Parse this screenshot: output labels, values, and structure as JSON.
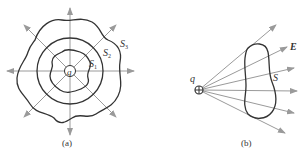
{
  "panel_a": {
    "caption": "(a)",
    "charge_label": "q",
    "surfaces": [
      {
        "name": "S1",
        "base": "S",
        "sub": "1",
        "shape": "irregular-inner"
      },
      {
        "name": "S2",
        "base": "S",
        "sub": "2",
        "shape": "circle"
      },
      {
        "name": "S3",
        "base": "S",
        "sub": "3",
        "shape": "irregular-outer"
      }
    ],
    "field_lines": 8
  },
  "panel_b": {
    "caption": "(b)",
    "charge_label": "q",
    "field_label": "E",
    "surface_label": "S",
    "field_lines": 7
  },
  "colors": {
    "surface": "#333333",
    "field_line": "#9a9a9a",
    "text": "#333333"
  }
}
